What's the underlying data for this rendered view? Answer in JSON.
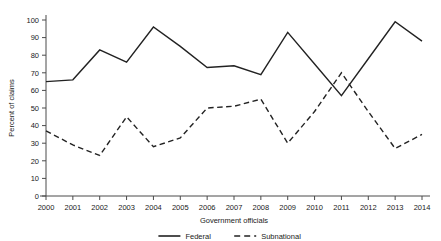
{
  "chart_data": {
    "type": "line",
    "title": "",
    "xlabel": "Government officials",
    "ylabel": "Percent of claims",
    "categories": [
      "2000",
      "2001",
      "2002",
      "2003",
      "2004",
      "2005",
      "2006",
      "2007",
      "2008",
      "2009",
      "2010",
      "2011",
      "2012",
      "2013",
      "2014"
    ],
    "x": [
      2000,
      2001,
      2002,
      2003,
      2004,
      2005,
      2006,
      2007,
      2008,
      2009,
      2010,
      2011,
      2012,
      2013,
      2014
    ],
    "xlim": [
      2000,
      2014
    ],
    "ylim": [
      0,
      100
    ],
    "yticks": [
      0,
      10,
      20,
      30,
      40,
      50,
      60,
      70,
      80,
      90,
      100
    ],
    "xticks": [
      "2000",
      "2001",
      "2002",
      "2003",
      "2004",
      "2005",
      "2006",
      "2007",
      "2008",
      "2009",
      "2010",
      "2011",
      "2012",
      "2013",
      "2014"
    ],
    "grid": false,
    "legend_position": "bottom",
    "series": [
      {
        "name": "Federal",
        "style": "solid",
        "color": "#222222",
        "values": [
          65,
          66,
          83,
          76,
          96,
          85,
          73,
          74,
          69,
          93,
          75,
          57,
          78,
          99,
          88
        ]
      },
      {
        "name": "Subnational",
        "style": "dashed",
        "color": "#222222",
        "values": [
          37,
          29,
          23,
          45,
          28,
          33,
          50,
          51,
          55,
          30,
          48,
          70,
          48,
          27,
          35
        ]
      }
    ]
  },
  "axes": {
    "y_label": "Percent of claims",
    "x_label": "Government officials"
  },
  "legend": {
    "items": [
      {
        "label": "Federal",
        "style": "solid"
      },
      {
        "label": "Subnational",
        "style": "dashed"
      }
    ]
  }
}
